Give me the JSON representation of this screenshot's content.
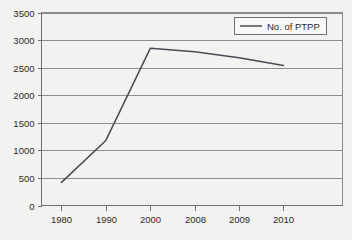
{
  "chart_data": {
    "type": "line",
    "title": "",
    "xlabel": "",
    "ylabel": "",
    "categories": [
      "1980",
      "1990",
      "2000",
      "2008",
      "2009",
      "2010"
    ],
    "series": [
      {
        "name": "No. of PTPP",
        "values": [
          420,
          1180,
          2850,
          2790,
          2680,
          2540
        ]
      }
    ],
    "ylim": [
      0,
      3500
    ],
    "y_ticks": [
      0,
      500,
      1000,
      1500,
      2000,
      2500,
      3000,
      3500
    ],
    "y_tick_labels": [
      "0",
      "500",
      "1000",
      "1500",
      "2000",
      "2500",
      "3000",
      "3500"
    ],
    "grid": true,
    "grid_axis": "y",
    "legend": {
      "position": "top-right",
      "entries": [
        {
          "label": "No. of PTPP",
          "marker": "line",
          "color": "#4a4a55"
        }
      ]
    },
    "colors": {
      "series_line": "#4a4a55",
      "gridline": "#8d8d8d",
      "axis": "#6f6f6f",
      "text": "#2b2b2b",
      "background": "#f7f7f5"
    }
  }
}
